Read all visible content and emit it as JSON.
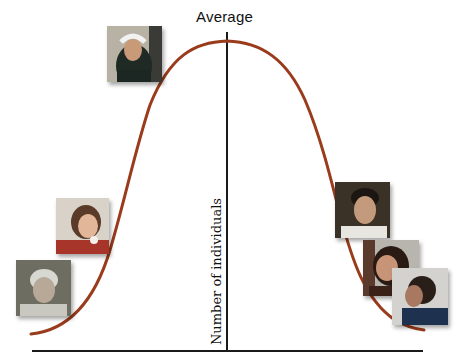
{
  "diagram": {
    "title": "Average",
    "y_axis_label": "Number of individuals",
    "curve": {
      "type": "bell-curve",
      "color": "#9a3b1c",
      "stroke_width": 3
    },
    "axis_color": "#111111",
    "photos": [
      {
        "id": "girl-headband",
        "description": "young girl with white headband",
        "position": "near peak, left"
      },
      {
        "id": "teen-girl",
        "description": "teenage girl eating",
        "position": "left tail, upper"
      },
      {
        "id": "elderly-man",
        "description": "elderly man with white hair",
        "position": "left tail, lower"
      },
      {
        "id": "young-man",
        "description": "young man",
        "position": "right tail, upper"
      },
      {
        "id": "woman-talking",
        "description": "woman talking",
        "position": "right tail, middle"
      },
      {
        "id": "woman-profile",
        "description": "woman in profile, blue top",
        "position": "right tail, lower"
      }
    ]
  }
}
